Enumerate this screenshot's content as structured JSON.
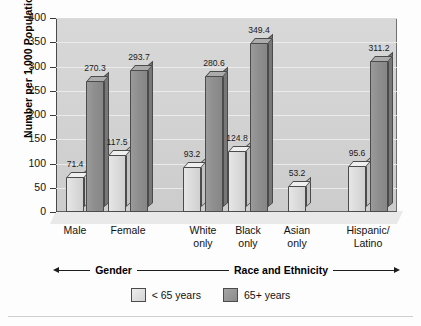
{
  "chart_data": {
    "type": "bar",
    "title": "",
    "xlabel": "",
    "ylabel": "Number per 1,000 Population",
    "ylim": [
      0,
      400
    ],
    "yticks": [
      0,
      50,
      100,
      150,
      200,
      250,
      300,
      350,
      400
    ],
    "grid": true,
    "legend_position": "bottom-center",
    "categories": [
      "Male",
      "Female",
      "White only",
      "Black only",
      "Asian only",
      "Hispanic/ Latino"
    ],
    "group_axes": [
      {
        "label": "Gender",
        "categories": [
          "Male",
          "Female"
        ]
      },
      {
        "label": "Race and Ethnicity",
        "categories": [
          "White only",
          "Black only",
          "Asian only",
          "Hispanic/ Latino"
        ]
      }
    ],
    "series": [
      {
        "name": "< 65 years",
        "values": [
          71.4,
          117.5,
          93.2,
          124.8,
          53.2,
          95.6
        ]
      },
      {
        "name": "65+ years",
        "values": [
          270.3,
          293.7,
          280.6,
          349.4,
          null,
          311.2
        ]
      }
    ]
  },
  "axis": {
    "y_title": "Number per 1,000 Population",
    "ticks": [
      {
        "value": 400,
        "label": "400"
      },
      {
        "value": 350,
        "label": "350"
      },
      {
        "value": 300,
        "label": "300"
      },
      {
        "value": 250,
        "label": "250"
      },
      {
        "value": 200,
        "label": "200"
      },
      {
        "value": 150,
        "label": "150"
      },
      {
        "value": 100,
        "label": "100"
      },
      {
        "value": 50,
        "label": "50"
      },
      {
        "value": 0,
        "label": "0"
      }
    ]
  },
  "categories": [
    {
      "line1": "Male",
      "line2": ""
    },
    {
      "line1": "Female",
      "line2": ""
    },
    {
      "line1": "White",
      "line2": "only"
    },
    {
      "line1": "Black",
      "line2": "only"
    },
    {
      "line1": "Asian",
      "line2": "only"
    },
    {
      "line1": "Hispanic/",
      "line2": "Latino"
    }
  ],
  "bars": [
    {
      "label": "Male < 65 years",
      "value": 71.4,
      "value_label": "71.4",
      "series": "< 65 years"
    },
    {
      "label": "Male 65+ years",
      "value": 270.3,
      "value_label": "270.3",
      "series": "65+ years"
    },
    {
      "label": "Female < 65 years",
      "value": 117.5,
      "value_label": "117.5",
      "series": "< 65 years"
    },
    {
      "label": "Female 65+ years",
      "value": 293.7,
      "value_label": "293.7",
      "series": "65+ years"
    },
    {
      "label": "White only < 65 years",
      "value": 93.2,
      "value_label": "93.2",
      "series": "< 65 years"
    },
    {
      "label": "White only 65+ years",
      "value": 280.6,
      "value_label": "280.6",
      "series": "65+ years"
    },
    {
      "label": "Black only < 65 years",
      "value": 124.8,
      "value_label": "124.8",
      "series": "< 65 years"
    },
    {
      "label": "Black only 65+ years",
      "value": 349.4,
      "value_label": "349.4",
      "series": "65+ years"
    },
    {
      "label": "Asian only < 65 years",
      "value": 53.2,
      "value_label": "53.2",
      "series": "< 65 years"
    },
    {
      "label": "Hispanic/Latino < 65 years",
      "value": 95.6,
      "value_label": "95.6",
      "series": "< 65 years"
    },
    {
      "label": "Hispanic/Latino 65+ years",
      "value": 311.2,
      "value_label": "311.2",
      "series": "65+ years"
    }
  ],
  "groups": {
    "gender": "Gender",
    "race_ethnicity": "Race and Ethnicity"
  },
  "legend": [
    {
      "label": "< 65 years",
      "style": "light",
      "color": "#d8d8d8"
    },
    {
      "label": "65+ years",
      "style": "dark",
      "color": "#909090"
    }
  ]
}
